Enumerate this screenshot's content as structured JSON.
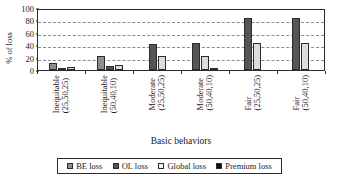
{
  "chart_data": {
    "type": "bar",
    "title": "",
    "xlabel": "Basic behaviors",
    "ylabel": "% of loss",
    "ylim": [
      0,
      100
    ],
    "yticks": [
      0,
      20,
      40,
      60,
      80,
      100
    ],
    "grid": true,
    "legend_position": "bottom",
    "categories": [
      "Inequitable (25,50,25)",
      "Inequitable (50,40,10)",
      "Moderate (25,50,25)",
      "Moderate (50,40,10)",
      "Fair (25,50,25)",
      "Fair (50,40,10)"
    ],
    "category_lines": [
      [
        "Inequitable",
        "(25,50,25)"
      ],
      [
        "Inequitable",
        "(50,40,10)"
      ],
      [
        "Moderate",
        "(25,50,25)"
      ],
      [
        "Moderate",
        "(50,40,10)"
      ],
      [
        "Fair",
        "(25,50,25)"
      ],
      [
        "Fair",
        "(50,40,10)"
      ]
    ],
    "series": [
      {
        "name": "BE loss",
        "color": "#8f8f8f",
        "values": [
          12,
          23,
          0,
          0,
          0,
          0
        ]
      },
      {
        "name": "OL loss",
        "color": "#555555",
        "values": [
          4,
          6,
          42,
          43,
          84,
          84
        ]
      },
      {
        "name": "Global loss",
        "color": "#dcdcdc",
        "values": [
          5,
          8,
          22,
          22,
          43,
          44
        ]
      },
      {
        "name": "Premium loss",
        "color": "#101010",
        "values": [
          0,
          0,
          0,
          1,
          0,
          0
        ]
      }
    ]
  },
  "legend": {
    "items": [
      {
        "label": "BE loss"
      },
      {
        "label": "OL loss"
      },
      {
        "label": "Global loss"
      },
      {
        "label": "Premium loss"
      }
    ]
  }
}
